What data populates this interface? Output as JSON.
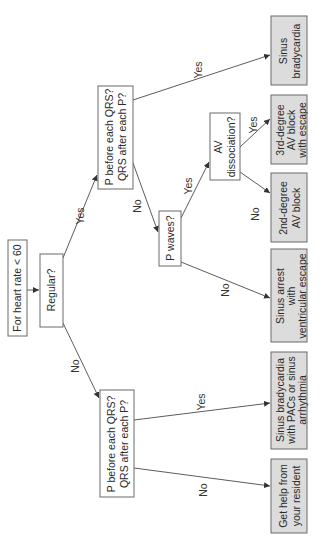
{
  "diagram": {
    "orientation": "rotated-90-ccw",
    "nodes": {
      "start": {
        "lines": [
          "For heart rate < 60"
        ]
      },
      "regular": {
        "lines": [
          "Regular?"
        ]
      },
      "p_qrs_regular": {
        "lines": [
          "P before each QRS?",
          "QRS after each P?"
        ]
      },
      "p_qrs_irregular": {
        "lines": [
          "P before each QRS?",
          "QRS after each P?"
        ]
      },
      "p_waves": {
        "lines": [
          "P waves?"
        ]
      },
      "av_dissociation": {
        "lines": [
          "AV",
          "dissociation?"
        ]
      },
      "out_sinus_brady": {
        "lines": [
          "Sinus",
          "bradycardia"
        ]
      },
      "out_3rd_degree": {
        "lines": [
          "3rd-degree",
          "AV block",
          "with escape"
        ]
      },
      "out_2nd_degree": {
        "lines": [
          "2nd-degree",
          "AV block"
        ]
      },
      "out_sinus_arrest": {
        "lines": [
          "Sinus arrest",
          "with",
          "ventricular escape"
        ]
      },
      "out_sinus_brady_pacs": {
        "lines": [
          "Sinus bradycardia",
          "with PACs or sinus",
          "arrhythmia"
        ]
      },
      "out_get_help": {
        "lines": [
          "Get help from",
          "your resident"
        ]
      }
    },
    "edge_labels": {
      "regular_yes": "Yes",
      "regular_no": "No",
      "pqrs_reg_yes": "Yes",
      "pqrs_reg_no": "No",
      "pwaves_yes": "Yes",
      "pwaves_no": "No",
      "avd_yes": "Yes",
      "avd_no": "No",
      "pqrs_irr_yes": "Yes",
      "pqrs_irr_no": "No"
    },
    "colors": {
      "outcome_fill": "#dcdcdc",
      "decision_fill": "#ffffff",
      "stroke": "#6a6a6a"
    }
  }
}
